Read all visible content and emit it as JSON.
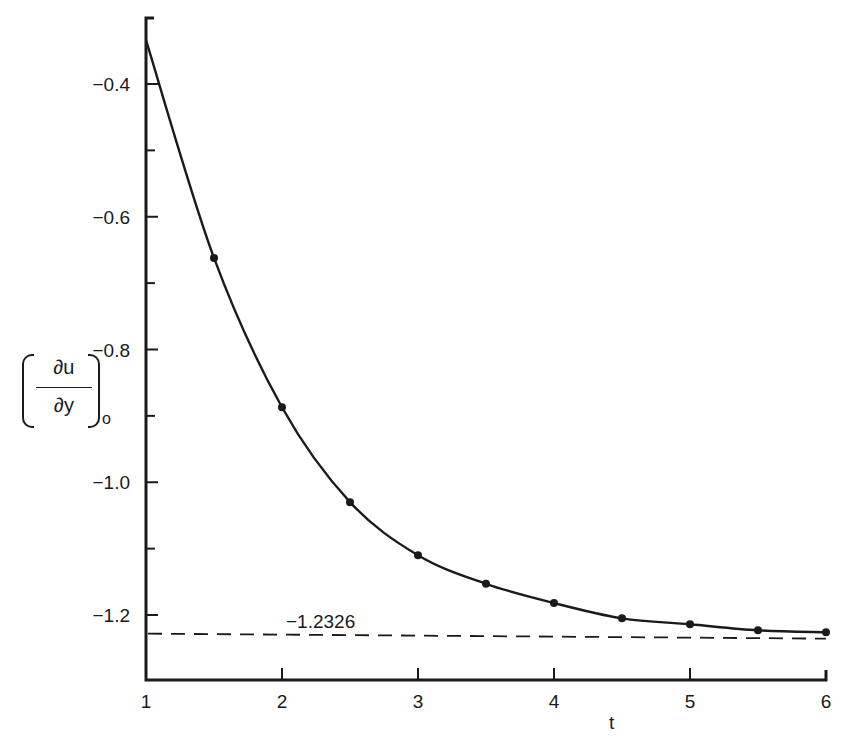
{
  "chart_data": {
    "type": "line",
    "title": "",
    "xlabel": "t",
    "ylabel": "(∂u/∂y)_o",
    "ylabel_parts": {
      "numerator": "∂u",
      "denominator": "∂y",
      "subscript": "o"
    },
    "xlim": [
      1,
      6
    ],
    "ylim": [
      -1.3,
      -0.3
    ],
    "x_ticks": [
      1,
      2,
      3,
      4,
      5,
      6
    ],
    "x_tick_labels": [
      "1",
      "2",
      "3",
      "4",
      "5",
      "6"
    ],
    "y_ticks": [
      -0.4,
      -0.6,
      -0.8,
      -1.0,
      -1.2
    ],
    "y_tick_labels": [
      "−0.4",
      "−0.6",
      "−0.8",
      "−1.0",
      "−1.2"
    ],
    "y_minor_ticks": [
      -0.5,
      -0.7,
      -0.9,
      -1.1
    ],
    "grid": false,
    "legend": null,
    "series": [
      {
        "name": "computed solution",
        "style": "solid line with dot markers",
        "x": [
          1.0,
          1.5,
          2.0,
          2.5,
          3.0,
          3.5,
          4.0,
          4.5,
          5.0,
          5.5,
          6.0
        ],
        "values": [
          -0.334,
          -0.662,
          -0.887,
          -1.03,
          -1.11,
          -1.153,
          -1.182,
          -1.205,
          -1.214,
          -1.223,
          -1.226
        ],
        "markers_at": [
          1.5,
          2.0,
          2.5,
          3.0,
          3.5,
          4.0,
          4.5,
          5.0,
          5.5,
          6.0
        ]
      },
      {
        "name": "asymptote",
        "style": "dashed horizontal line",
        "x": [
          1,
          6
        ],
        "values": [
          -1.2326,
          -1.2326
        ]
      }
    ],
    "annotations": [
      {
        "text": "−1.2326",
        "x": 2.0,
        "y": -1.2326
      }
    ]
  }
}
